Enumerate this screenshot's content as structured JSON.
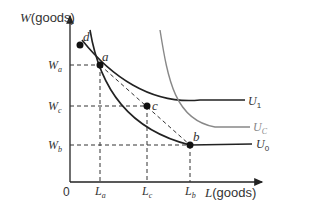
{
  "axes": {
    "y_label_var": "W",
    "y_label_unit": "(goods)",
    "x_label_var": "L",
    "x_label_unit": "(goods)",
    "origin": "0"
  },
  "y_ticks": [
    {
      "main": "W",
      "sub": "a"
    },
    {
      "main": "W",
      "sub": "c"
    },
    {
      "main": "W",
      "sub": "b"
    }
  ],
  "x_ticks": [
    {
      "main": "L",
      "sub": "a"
    },
    {
      "main": "L",
      "sub": "c"
    },
    {
      "main": "L",
      "sub": "b"
    }
  ],
  "points": [
    {
      "label": "d"
    },
    {
      "label": "a"
    },
    {
      "label": "c"
    },
    {
      "label": "b"
    }
  ],
  "curves": [
    {
      "main": "U",
      "sub": "1",
      "color": "#222222"
    },
    {
      "main": "U",
      "sub": "C",
      "color": "#888888"
    },
    {
      "main": "U",
      "sub": "0",
      "color": "#222222"
    }
  ]
}
